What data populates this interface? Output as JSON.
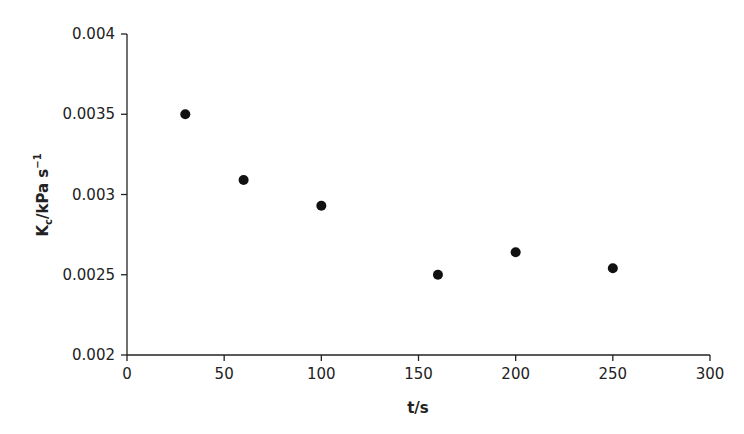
{
  "chart_data": {
    "type": "scatter",
    "title": "",
    "xlabel": "t/s",
    "ylabel": "Kc/kPa s^-1",
    "ylabel_parts": {
      "main": "K",
      "sub": "c",
      "rest": "/kPa s",
      "sup": "−1"
    },
    "xlim": [
      0,
      300
    ],
    "ylim": [
      0.002,
      0.004
    ],
    "xticks": [
      0,
      50,
      100,
      150,
      200,
      250,
      300
    ],
    "xtick_labels": [
      "0",
      "50",
      "100",
      "150",
      "200",
      "250",
      "300"
    ],
    "yticks": [
      0.002,
      0.0025,
      0.003,
      0.0035,
      0.004
    ],
    "ytick_labels": [
      "0.002",
      "0.0025",
      "0.003",
      "0.0035",
      "0.004"
    ],
    "grid": false,
    "legend": null,
    "series": [
      {
        "name": "Kc",
        "marker": "filled-circle",
        "color": "#111111",
        "x": [
          30,
          60,
          100,
          160,
          200,
          250
        ],
        "y": [
          0.0035,
          0.00309,
          0.00293,
          0.0025,
          0.00264,
          0.00254
        ]
      }
    ]
  },
  "layout": {
    "plot_left": 127,
    "plot_right": 710,
    "plot_top": 34,
    "plot_bottom": 355,
    "axis_color": "#222222"
  }
}
